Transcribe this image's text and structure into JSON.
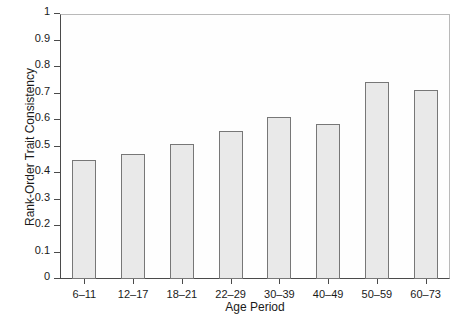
{
  "chart_data": {
    "type": "bar",
    "title": "",
    "xlabel": "Age Period",
    "ylabel": "Rank-Order Trait Consistency",
    "categories": [
      "6–11",
      "12–17",
      "18–21",
      "22–29",
      "30–39",
      "40–49",
      "50–59",
      "60–73"
    ],
    "values": [
      0.45,
      0.47,
      0.51,
      0.56,
      0.61,
      0.585,
      0.745,
      0.715
    ],
    "ylim": [
      0,
      1
    ],
    "yticks": [
      "0",
      "0.1",
      "0.2",
      "0.3",
      "0.4",
      "0.5",
      "0.6",
      "0.7",
      "0.8",
      "0.9",
      "1"
    ],
    "ytick_values": [
      0,
      0.1,
      0.2,
      0.3,
      0.4,
      0.5,
      0.6,
      0.7,
      0.8,
      0.9,
      1
    ],
    "grid": false,
    "legend": null,
    "bar_fill_color": "#e9e9e9",
    "bar_edge_color": "#777777",
    "axis_color": "#4a4a4a",
    "background_color": "#ffffff"
  }
}
